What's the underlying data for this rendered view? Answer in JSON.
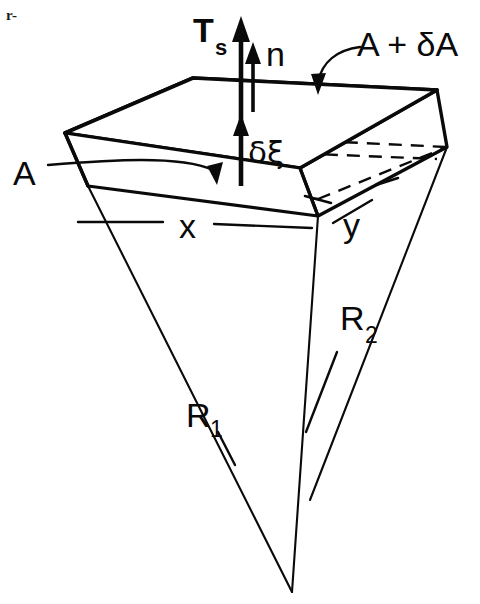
{
  "figure": {
    "kind": "scientific-line-diagram",
    "corner_note": "r-",
    "ink_color": "#0a0a0a",
    "background_color": "#ffffff"
  },
  "labels": {
    "surface_tension": {
      "text": "T",
      "subscript": "s",
      "name": "surface-tension-symbol"
    },
    "normal": {
      "text": "n",
      "name": "unit-normal-symbol"
    },
    "area_upper": {
      "text": "A + δA",
      "name": "upper-area-symbol"
    },
    "area_lower": {
      "text": "A",
      "name": "lower-area-symbol"
    },
    "thickness": {
      "text": "δξ",
      "name": "thickness-symbol"
    },
    "side_x": {
      "text": "x",
      "name": "side-length-x"
    },
    "side_y": {
      "text": "y",
      "name": "side-length-y"
    },
    "radius_1": {
      "text": "R",
      "subscript": "1",
      "name": "principal-radius-1"
    },
    "radius_2": {
      "text": "R",
      "subscript": "2",
      "name": "principal-radius-2"
    }
  },
  "geometry": {
    "top_face_vertices": "65,133 193,78 437,90 300,168",
    "front_face_vertices": "65,133 300,168 318,216 88,186",
    "apex": "292,592",
    "stipple_seed": 1
  }
}
